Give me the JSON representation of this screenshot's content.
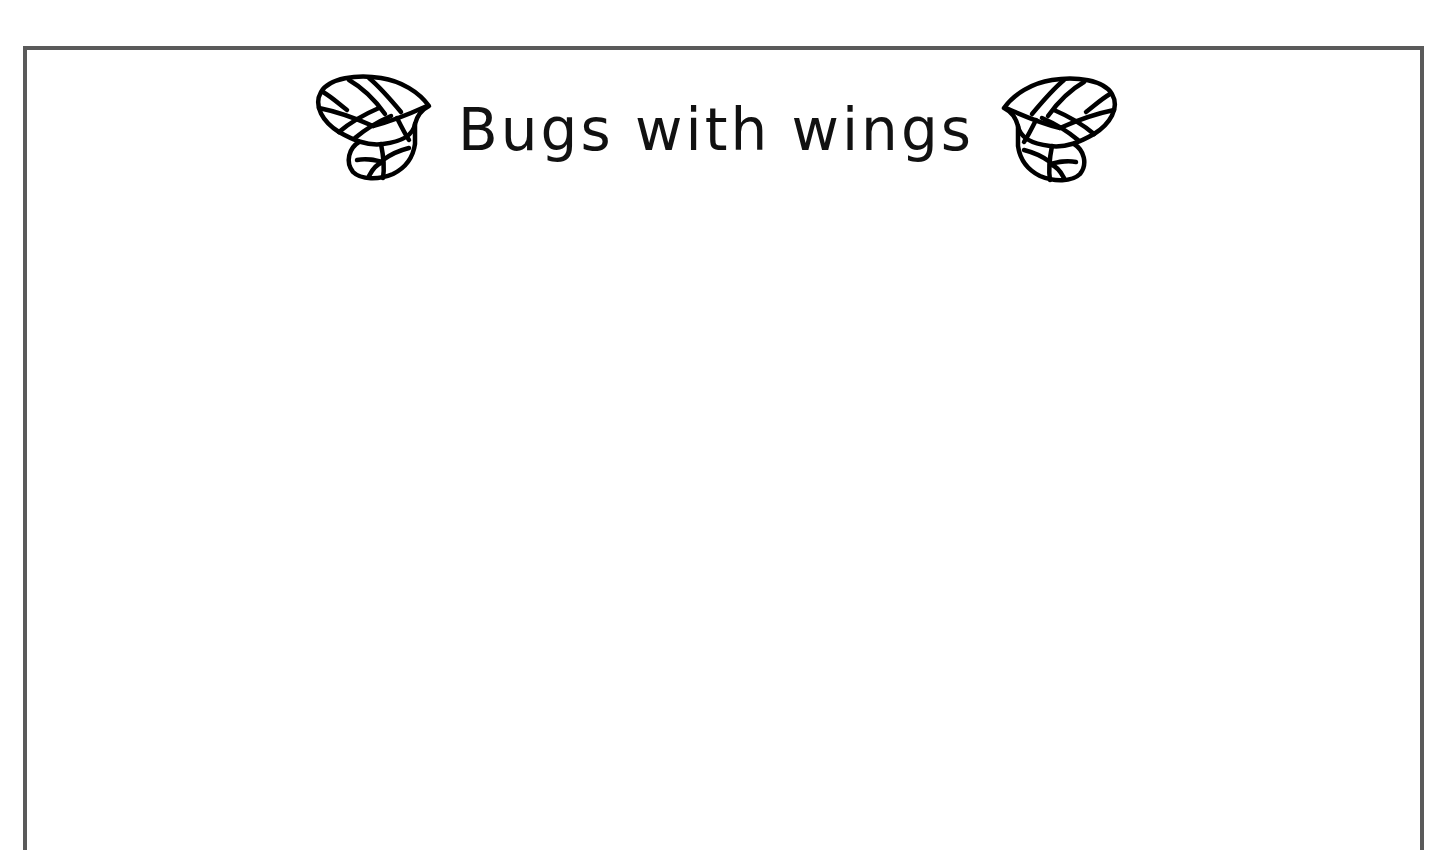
{
  "document": {
    "title": "Bugs with wings",
    "decorations": {
      "left_icon": "wing-icon",
      "right_icon": "wing-icon"
    },
    "body": ""
  },
  "colors": {
    "border": "#5a5a5a",
    "text": "#111111",
    "background": "#ffffff"
  }
}
